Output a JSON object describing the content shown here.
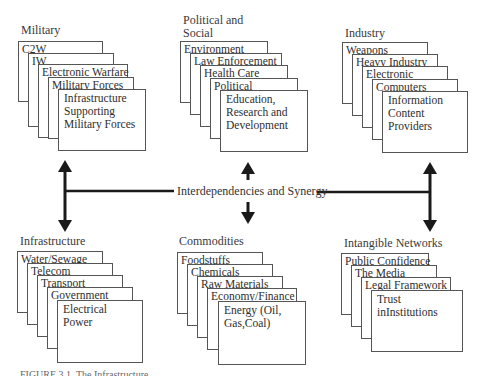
{
  "groups": [
    {
      "title": "Military",
      "cards": [
        "C2W",
        "IW",
        "Electronic Warfare",
        "Military Forces",
        "Infrastructure Supporting Military Forces"
      ]
    },
    {
      "title": "Political and Social",
      "cards": [
        "Environment",
        "Law Enforcement",
        "Health Care",
        "Political",
        "Education, Research and Development"
      ]
    },
    {
      "title": "Industry",
      "cards": [
        "Weapons",
        "Heavy Industry",
        "Electronic",
        "Computers",
        "Information Content Providers"
      ]
    },
    {
      "title": "Infrastructure",
      "cards": [
        "Water/Sewage",
        "Telecom",
        "Transport",
        "Government",
        "Electrical Power"
      ]
    },
    {
      "title": "Commodities",
      "cards": [
        "Foodstuffs",
        "Chemicals",
        "Raw Materials",
        "Economy/Finance",
        "Energy (Oil, Gas,Coal)"
      ]
    },
    {
      "title": "Intangible Networks",
      "cards": [
        "Public Confidence",
        "The Media",
        "Legal Framework",
        "Trust inInstitutions"
      ]
    }
  ],
  "center_label": "Interdependencies and Synergy",
  "caption": "FIGURE 3.1. The Infrastructure"
}
